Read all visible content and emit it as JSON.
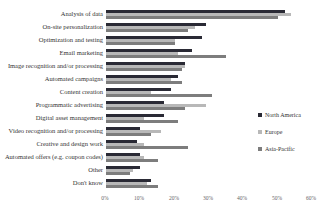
{
  "chart_data": {
    "type": "bar",
    "orientation": "horizontal",
    "title": "",
    "categories": [
      "Analysis of data",
      "On-site personalization",
      "Optimization and testing",
      "Email marketing",
      "Image recognition and/or processing",
      "Automated campaigns",
      "Content creation",
      "Programmatic advertising",
      "Digital asset management",
      "Video recognition and/or processing",
      "Creative and design work",
      "Automated offers (e.g. coupon codes)",
      "Other",
      "Don't know"
    ],
    "series": [
      {
        "name": "North America",
        "color": "#2a2a35",
        "values": [
          52,
          29,
          28,
          25,
          23,
          21,
          19,
          17,
          17,
          10,
          9,
          10,
          10,
          13
        ]
      },
      {
        "name": "Europe",
        "color": "#b8b8b8",
        "values": [
          54,
          26,
          20,
          21,
          23,
          19,
          13,
          29,
          11,
          16,
          11,
          11,
          8,
          12
        ]
      },
      {
        "name": "Asia-Pacific",
        "color": "#7d7d7d",
        "values": [
          50,
          24,
          20,
          35,
          22,
          22,
          31,
          23,
          21,
          13,
          24,
          15,
          7,
          15
        ]
      }
    ],
    "xlabel": "",
    "ylabel": "",
    "xlim": [
      0,
      60
    ],
    "x_ticks": [
      "0%",
      "10%",
      "20%",
      "30%",
      "40%",
      "50%",
      "60%"
    ],
    "x_tick_values": [
      0,
      10,
      20,
      30,
      40,
      50,
      60
    ],
    "grid": false,
    "legend_position": "right"
  }
}
